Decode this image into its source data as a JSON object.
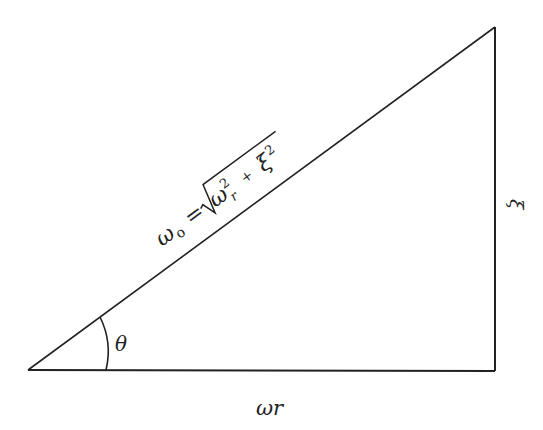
{
  "diagram": {
    "type": "right-triangle",
    "labels": {
      "hypotenuse_lhs": "ω",
      "hypotenuse_lhs_sub": "o",
      "hypotenuse_eq": "=",
      "hypotenuse_term1": "ω",
      "hypotenuse_term1_sup": "2",
      "hypotenuse_term1_sub": "r",
      "hypotenuse_plus": "+",
      "hypotenuse_term2": "ξ",
      "hypotenuse_term2_sup": "2",
      "angle": "θ",
      "base": "ωr",
      "vertical_side": "ξ"
    },
    "colors": {
      "stroke": "#222222",
      "background": "#ffffff"
    }
  }
}
